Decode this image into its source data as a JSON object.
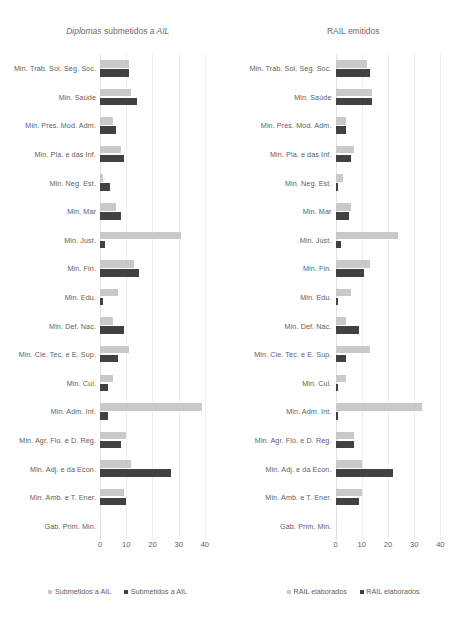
{
  "page": {
    "top_remnant": "· ·"
  },
  "charts": [
    {
      "id": "chart-diplomas",
      "title_parts": {
        "lead": "Diplomas",
        "mid": " submetidos ",
        "tail": "a AIL"
      },
      "title_full": "Diplomas submetidos a AIL",
      "axis": {
        "min": 0,
        "max": 45,
        "ticks": [
          0,
          10,
          20,
          30,
          40
        ],
        "tick_labels": [
          "0",
          "10",
          "20",
          "30",
          "40"
        ]
      },
      "legend": [
        {
          "label": "Submetidos a AIL",
          "color": "#c9c9c9",
          "swatch": "light"
        },
        {
          "label": "Submetidos a AIL",
          "color": "#414141",
          "swatch": "dark"
        }
      ]
    },
    {
      "id": "chart-rail",
      "title_parts": {
        "lead": "",
        "mid": "RAIL emitidos",
        "tail": ""
      },
      "title_full": "RAIL emitidos",
      "axis": {
        "min": 0,
        "max": 45,
        "ticks": [
          0,
          10,
          20,
          30,
          40
        ],
        "tick_labels": [
          "0",
          "10",
          "20",
          "30",
          "40"
        ]
      },
      "legend": [
        {
          "label": "RAIL elaborados",
          "color": "#c9c9c9",
          "swatch": "light"
        },
        {
          "label": "RAIL elaborados",
          "color": "#414141",
          "swatch": "dark"
        }
      ]
    }
  ],
  "chart_data": [
    {
      "type": "bar",
      "orientation": "horizontal",
      "title": "Diplomas submetidos a AIL",
      "xlabel": "",
      "ylabel": "",
      "xlim": [
        0,
        45
      ],
      "xticks": [
        0,
        10,
        20,
        30,
        40
      ],
      "grid": true,
      "legend_position": "bottom",
      "categories": [
        "Min. Trab. Sol. Seg. Soc.",
        "Min. Saúde",
        "Min. Pres. Mod. Adm.",
        "Min. Pla. e das Inf.",
        "Min. Neg. Est.",
        "Min. Mar",
        "Min. Just.",
        "Min. Fin.",
        "Min. Edu.",
        "Min. Def. Nac.",
        "Min. Cie. Tec. e E. Sup.",
        "Min. Cul.",
        "Min. Adm. Int.",
        "Min. Agr. Flo. e D. Reg.",
        "Min. Adj. e da Econ.",
        "Min. Amb. e T. Ener.",
        "Gab. Prim. Min."
      ],
      "series": [
        {
          "name": "Submetidos a AIL",
          "color": "#c9c9c9",
          "values": [
            11,
            12,
            5,
            8,
            1,
            6,
            31,
            13,
            7,
            5,
            11,
            5,
            39,
            10,
            12,
            9,
            0
          ]
        },
        {
          "name": "Submetidos a AIL",
          "color": "#414141",
          "values": [
            11,
            14,
            6,
            9,
            4,
            8,
            2,
            15,
            1,
            9,
            7,
            3,
            3,
            8,
            27,
            10,
            0
          ]
        }
      ]
    },
    {
      "type": "bar",
      "orientation": "horizontal",
      "title": "RAIL emitidos",
      "xlabel": "",
      "ylabel": "",
      "xlim": [
        0,
        45
      ],
      "xticks": [
        0,
        10,
        20,
        30,
        40
      ],
      "grid": true,
      "legend_position": "bottom",
      "categories": [
        "Min. Trab. Sol. Seg. Soc.",
        "Min. Saúde",
        "Min. Pres. Mod. Adm.",
        "Min. Pla. e das Inf.",
        "Min. Neg. Est.",
        "Min. Mar",
        "Min. Just.",
        "Min. Fin.",
        "Min. Edu.",
        "Min. Def. Nac.",
        "Min. Cie. Tec. e E. Sup.",
        "Min. Cul.",
        "Min. Adm. Int.",
        "Min. Agr. Flo. e D. Reg.",
        "Min. Adj. e da Econ.",
        "Min. Amb. e T. Ener.",
        "Gab. Prim. Min."
      ],
      "series": [
        {
          "name": "RAIL elaborados",
          "color": "#c9c9c9",
          "values": [
            12,
            14,
            4,
            7,
            3,
            6,
            24,
            13,
            6,
            4,
            13,
            4,
            33,
            7,
            10,
            10,
            0
          ]
        },
        {
          "name": "RAIL elaborados",
          "color": "#414141",
          "values": [
            13,
            14,
            4,
            6,
            1,
            5,
            2,
            11,
            1,
            9,
            4,
            1,
            1,
            7,
            22,
            9,
            0
          ]
        }
      ]
    }
  ]
}
